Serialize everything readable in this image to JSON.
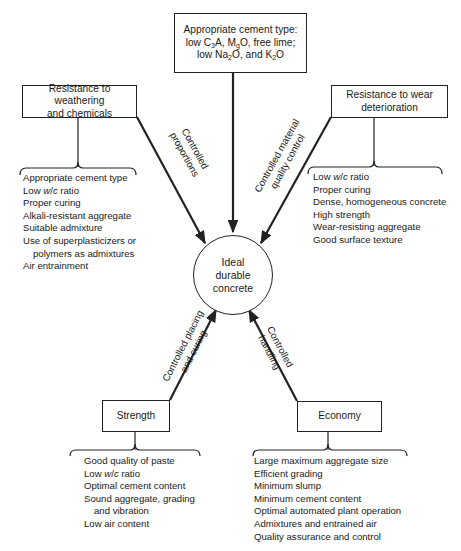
{
  "center": {
    "line1": "Ideal",
    "line2": "durable",
    "line3": "concrete"
  },
  "top_factor": {
    "line1": "Appropriate cement type:",
    "line2_prefix": "low C",
    "line2_sub1": "3",
    "line2_mid": "A, M",
    "line2_sub2": "g",
    "line2_suffix": "O, free lime;",
    "line3_prefix": "low Na",
    "line3_sub1": "2",
    "line3_mid": "O, and K",
    "line3_sub2": "2",
    "line3_suffix": "O"
  },
  "weathering": {
    "title_line1": "Resistance to weathering",
    "title_line2": "and chemicals",
    "arrow_label_line1": "Controlled",
    "arrow_label_line2": "proportions",
    "items": [
      "Appropriate cement type",
      "Low w/c ratio",
      "Proper curing",
      "Alkali-resistant aggregate",
      "Suitable admixture",
      "Use of superplasticizers or",
      "polymers as admixtures",
      "Air entrainment"
    ]
  },
  "wear": {
    "title_line1": "Resistance to wear",
    "title_line2": "deterioration",
    "arrow_label_line1": "Controlled material",
    "arrow_label_line2": "quality control",
    "items": [
      "Low w/c ratio",
      "Proper curing",
      "Dense, homogeneous concrete",
      "High strength",
      "Wear-resisting aggregate",
      "Good surface texture"
    ]
  },
  "strength": {
    "title": "Strength",
    "arrow_label_line1": "Controlled placing",
    "arrow_label_line2": "and curing",
    "items": [
      "Good quality of paste",
      "Low w/c ratio",
      "Optimal cement content",
      "Sound aggregate, grading",
      "and vibration",
      "Low air content"
    ]
  },
  "economy": {
    "title": "Economy",
    "arrow_label_line1": "Controlled",
    "arrow_label_line2": "handling",
    "items": [
      "Large maximum aggregate size",
      "Efficient grading",
      "Minimum slump",
      "Minimum cement content",
      "Optimal automated plant operation",
      "Admixtures and entrained air",
      "Quality assurance and control"
    ]
  },
  "wc": {
    "w": "w",
    "slash": "/",
    "c": "c",
    "ratio": " ratio",
    "low": "Low "
  }
}
